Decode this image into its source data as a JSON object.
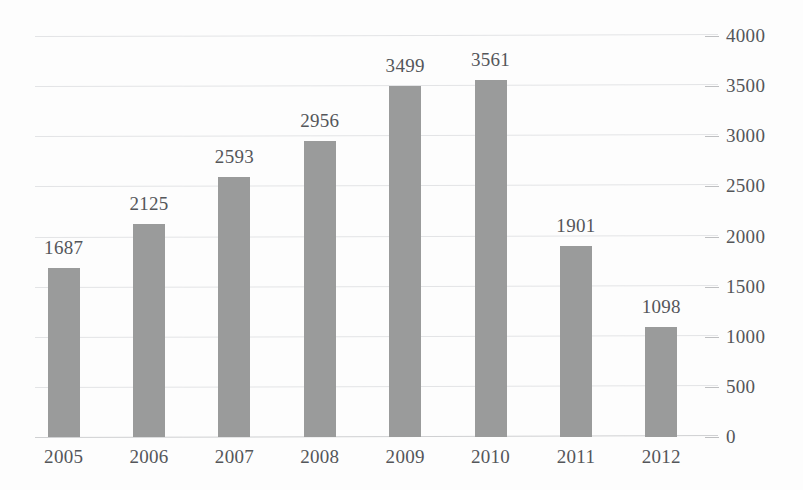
{
  "chart_data": {
    "type": "bar",
    "title": "",
    "subtitle": "",
    "xlabel": "",
    "ylabel": "",
    "categories": [
      "2005",
      "2006",
      "2007",
      "2008",
      "2009",
      "2010",
      "2011",
      "2012"
    ],
    "values": [
      1687,
      2125,
      2593,
      2956,
      3499,
      3561,
      1901,
      1098
    ],
    "data_labels": [
      "1687",
      "2125",
      "2593",
      "2956",
      "3499",
      "3561",
      "1901",
      "1098"
    ],
    "ylim": [
      0,
      4000
    ],
    "ytick_labels": [
      "4000",
      "3500",
      "3000",
      "2500",
      "2000",
      "1500",
      "1000",
      "500",
      "0"
    ],
    "ytick_values": [
      4000,
      3500,
      3000,
      2500,
      2000,
      1500,
      1000,
      500,
      0
    ],
    "ytick_step": 500,
    "grid": true,
    "grid_axis": "y",
    "legend": false,
    "legend_position": "none",
    "y_axis_position": "right",
    "bar_color": "#9a9b9b",
    "gridline_color": "#e3e4e6",
    "axis_line_color": "#cfd0d2",
    "text_color": "#54565a",
    "background_color": "#fdfdfd",
    "annotations": []
  }
}
